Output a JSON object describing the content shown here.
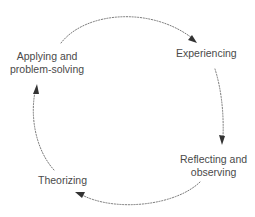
{
  "diagram": {
    "type": "cycle",
    "direction": "clockwise",
    "colors": {
      "background": "#ffffff",
      "text": "#4a4a4a",
      "connector": "#6a6a6a",
      "arrowhead": "#333333"
    },
    "stages": [
      {
        "id": "experiencing",
        "lines": [
          "Experiencing"
        ]
      },
      {
        "id": "reflecting",
        "lines": [
          "Reflecting and",
          "observing"
        ]
      },
      {
        "id": "theorizing",
        "lines": [
          "Theorizing"
        ]
      },
      {
        "id": "applying",
        "lines": [
          "Applying and",
          "problem-solving"
        ]
      }
    ],
    "connectors": [
      {
        "from": "applying",
        "to": "experiencing",
        "style": "dotted-arrow"
      },
      {
        "from": "experiencing",
        "to": "reflecting",
        "style": "dotted-arrow"
      },
      {
        "from": "reflecting",
        "to": "theorizing",
        "style": "dotted-arrow"
      },
      {
        "from": "theorizing",
        "to": "applying",
        "style": "dotted-arrow"
      }
    ]
  }
}
